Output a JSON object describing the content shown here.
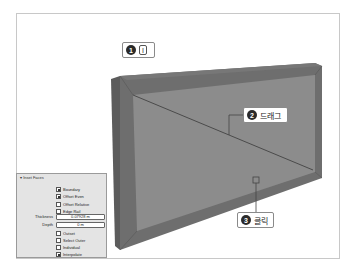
{
  "callouts": [
    {
      "number": "1",
      "key": "I"
    },
    {
      "number": "2",
      "text": "드래그"
    },
    {
      "number": "3",
      "text": "클릭"
    }
  ],
  "panel": {
    "title": "Inset Faces",
    "checkboxes_top": [
      {
        "label": "Boundary",
        "checked": true
      },
      {
        "label": "Offset Even",
        "checked": true
      },
      {
        "label": "Offset Relative",
        "checked": false
      },
      {
        "label": "Edge Rail",
        "checked": false
      }
    ],
    "fields": [
      {
        "label": "Thickness",
        "value": "0.07928 m"
      },
      {
        "label": "Depth",
        "value": "0 m"
      }
    ],
    "checkboxes_bottom": [
      {
        "label": "Outset",
        "checked": false
      },
      {
        "label": "Select Outer",
        "checked": false
      },
      {
        "label": "Individual",
        "checked": false
      },
      {
        "label": "Interpolate",
        "checked": true
      }
    ]
  },
  "colors": {
    "face_front": "#8c8c8c",
    "face_rim": "#6e6e6e",
    "face_side": "#5c5c5c",
    "edge_line": "#3a3a3a"
  }
}
